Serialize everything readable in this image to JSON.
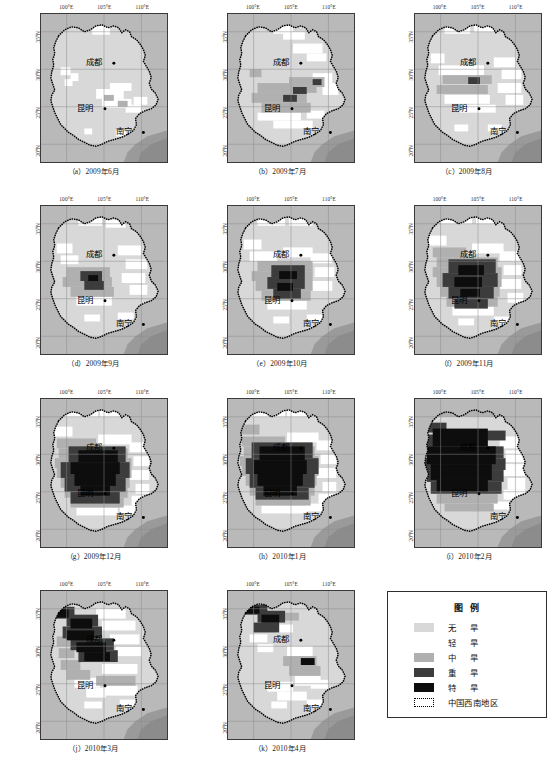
{
  "figure": {
    "rows": 4,
    "cols": 3
  },
  "axis": {
    "lon_ticks": [
      "100°E",
      "105°E",
      "110°E"
    ],
    "lat_ticks": [
      "35°N",
      "30°N",
      "25°N",
      "20°N"
    ]
  },
  "cities": [
    {
      "name": "成都",
      "x": 62,
      "y": 46
    },
    {
      "name": "昆明",
      "x": 53,
      "y": 92
    },
    {
      "name": "南宁",
      "x": 92,
      "y": 116
    }
  ],
  "panels": [
    {
      "id": "a",
      "caption": "（a）2009年6月",
      "label": "(a)",
      "period": "2009年6月"
    },
    {
      "id": "b",
      "caption": "（b）2009年7月",
      "label": "(b)",
      "period": "2009年7月"
    },
    {
      "id": "c",
      "caption": "（c）2009年8月",
      "label": "(c)",
      "period": "2009年8月"
    },
    {
      "id": "d",
      "caption": "（d）2009年9月",
      "label": "(d)",
      "period": "2009年9月"
    },
    {
      "id": "e",
      "caption": "（e）2009年10月",
      "label": "(e)",
      "period": "2009年10月"
    },
    {
      "id": "f",
      "caption": "（f）2009年11月",
      "label": "(f)",
      "period": "2009年11月"
    },
    {
      "id": "g",
      "caption": "（g）2009年12月",
      "label": "(g)",
      "period": "2009年12月"
    },
    {
      "id": "h",
      "caption": "（h）2010年1月",
      "label": "(h)",
      "period": "2010年1月"
    },
    {
      "id": "i",
      "caption": "（i）2010年2月",
      "label": "(i)",
      "period": "2010年2月"
    },
    {
      "id": "j",
      "caption": "（j）2010年3月",
      "label": "(j)",
      "period": "2010年3月"
    },
    {
      "id": "k",
      "caption": "（k）2010年4月",
      "label": "(k)",
      "period": "2010年4月"
    }
  ],
  "legend": {
    "title": "图例",
    "items": [
      {
        "label": "无　旱",
        "color": "#d8d8d8",
        "severity": "none"
      },
      {
        "label": "轻　旱",
        "color": "#ffffff",
        "severity": "light"
      },
      {
        "label": "中　旱",
        "color": "#b0b0b0",
        "severity": "moderate"
      },
      {
        "label": "重　旱",
        "color": "#3c3c3c",
        "severity": "severe"
      },
      {
        "label": "特　旱",
        "color": "#0d0d0d",
        "severity": "extreme"
      },
      {
        "label": "中国西南地区",
        "color": "#ffffff",
        "severity": "region-boundary"
      }
    ]
  },
  "colors": {
    "background": "#b9b9b9",
    "none": "#d8d8d8",
    "light": "#ffffff",
    "moderate": "#b0b0b0",
    "severe": "#3c3c3c",
    "extreme": "#0d0d0d",
    "grid": "#8a8a8a",
    "frame": "#3a3a3a",
    "boundary": "#000000",
    "sea": "#9a9a9a"
  }
}
